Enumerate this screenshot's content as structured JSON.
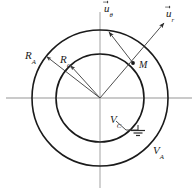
{
  "figure": {
    "background_color": "#ffffff",
    "curve_color": "#1a1a1a",
    "axis_color": "#b3b3b3",
    "leader_color": "#3a3a3a"
  },
  "geometry": {
    "center": {
      "x": 100,
      "y": 98
    },
    "outer_circle_radius": 68,
    "inner_circle_radius": 44,
    "point_M": {
      "x": 133,
      "y": 63
    },
    "horizontal_axis": {
      "x1": 6,
      "y1": 98,
      "x2": 192,
      "y2": 98
    },
    "vertical_axis": {
      "x1": 100,
      "y1": 12,
      "x2": 100,
      "y2": 188
    }
  },
  "labels": {
    "radius_outer": {
      "base": "R",
      "sub": "A",
      "x": 25,
      "y": 50
    },
    "radius_inner": {
      "base": "R",
      "sub": "C",
      "x": 60,
      "y": 54
    },
    "point_label": {
      "base": "M",
      "sub": "",
      "x": 139,
      "y": 60
    },
    "potential_inner": {
      "base": "V",
      "sub": "C",
      "x": 110,
      "y": 114
    },
    "potential_outer": {
      "base": "V",
      "sub": "A",
      "x": 153,
      "y": 145
    }
  },
  "vectors": {
    "u_theta": {
      "base": "u",
      "sub": "θ",
      "x": 104,
      "y": 3
    },
    "u_r": {
      "base": "u",
      "sub": "r",
      "x": 166,
      "y": 8
    }
  },
  "symbols": {
    "ground": {
      "name": "ground-symbol",
      "x": 132,
      "y": 133
    }
  }
}
